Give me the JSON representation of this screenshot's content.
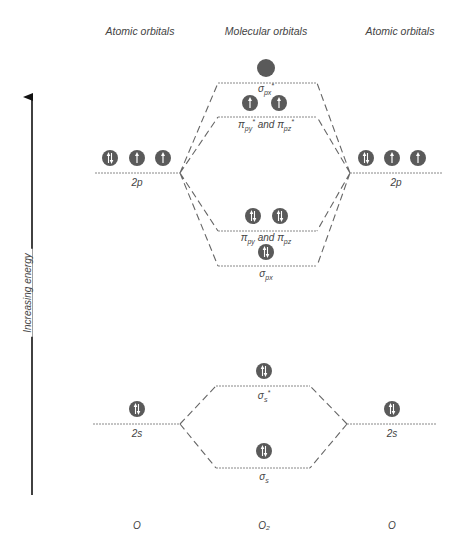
{
  "headers": {
    "left": "Atomic orbitals",
    "center": "Molecular orbitals",
    "right": "Atomic orbitals"
  },
  "axis": {
    "label": "Increasing energy",
    "direction": "up"
  },
  "atoms": {
    "left": "O",
    "center": "O₂",
    "right": "O"
  },
  "levels": {
    "left_2p": {
      "label": "2p",
      "electrons": [
        "paired",
        "up",
        "up"
      ]
    },
    "right_2p": {
      "label": "2p",
      "electrons": [
        "paired",
        "up",
        "up"
      ]
    },
    "sigma_px_star": {
      "label": "σpx*",
      "electrons": [
        "empty"
      ]
    },
    "pi_star": {
      "label": "πpy* and πpz*",
      "electrons": [
        "up",
        "up"
      ]
    },
    "pi": {
      "label": "πpy and πpz",
      "electrons": [
        "paired",
        "paired"
      ]
    },
    "sigma_px": {
      "label": "σpx",
      "electrons": [
        "paired"
      ]
    },
    "left_2s": {
      "label": "2s",
      "electrons": [
        "paired"
      ]
    },
    "right_2s": {
      "label": "2s",
      "electrons": [
        "paired"
      ]
    },
    "sigma_s_star": {
      "label": "σs*",
      "electrons": [
        "paired"
      ]
    },
    "sigma_s": {
      "label": "σs",
      "electrons": [
        "paired"
      ]
    }
  },
  "text": {
    "sigma_px_star_main": "σ",
    "sigma_px_star_sub": "px",
    "sigma_px_star_sup": "*",
    "pi_star_a": "π",
    "pi_star_a_sub": "py",
    "pi_star_and": " and ",
    "pi_star_b": "π",
    "pi_star_b_sub": "pz",
    "star": "*",
    "pi_a": "π",
    "pi_a_sub": "py",
    "pi_and": " and ",
    "pi_b": "π",
    "pi_b_sub": "pz",
    "sigma_px_main": "σ",
    "sigma_px_sub": "px",
    "sigma_s_star_main": "σ",
    "sigma_s_star_sub": "s",
    "sigma_s_main": "σ",
    "sigma_s_sub": "s",
    "left_2p": "2p",
    "right_2p": "2p",
    "left_2s": "2s",
    "right_2s": "2s"
  },
  "colors": {
    "circle": "#5a5a5a",
    "line": "#777777",
    "arrow": "#111111"
  }
}
